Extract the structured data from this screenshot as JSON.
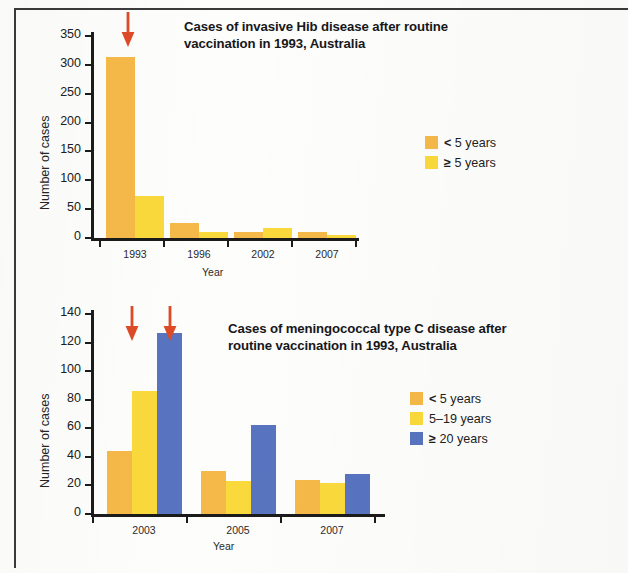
{
  "figure": {
    "background_color": "#fdfdfc",
    "border_color": "#3a3a3a"
  },
  "colors": {
    "orange": "#f5b949",
    "yellow": "#fad93c",
    "blue": "#5874c0",
    "arrow": "#dd4a26",
    "axis": "#1b1b1b"
  },
  "chart_data": [
    {
      "id": "hib",
      "type": "bar",
      "title": "Cases of invasive Hib disease after routine vaccination in 1993, Australia",
      "title_line1": "Cases of invasive Hib disease after routine",
      "title_line2": "vaccination in 1993, Australia",
      "xlabel": "Year",
      "ylabel": "Number of cases",
      "categories": [
        "1993",
        "1996",
        "2002",
        "2007"
      ],
      "ylim": [
        0,
        350
      ],
      "yticks": [
        0,
        50,
        100,
        150,
        200,
        250,
        300,
        350
      ],
      "ytick_labels": [
        "0",
        "50",
        "100",
        "150",
        "200",
        "250",
        "300",
        "350"
      ],
      "grid": false,
      "legend_position": "right",
      "series": [
        {
          "name": "< 5 years",
          "legend_prefix": "<",
          "legend_suffix": " 5 years",
          "color": "#f5b949",
          "values": [
            313,
            26,
            10,
            11
          ]
        },
        {
          "name": "≥ 5 years",
          "legend_prefix": "≥",
          "legend_suffix": " 5 years",
          "color": "#fad93c",
          "values": [
            73,
            10,
            18,
            6
          ]
        }
      ],
      "annotations": [
        {
          "type": "arrow",
          "label": "vaccination-introduced-arrow",
          "category": "1993",
          "direction": "down"
        }
      ]
    },
    {
      "id": "menc",
      "type": "bar",
      "title": "Cases of meningococcal type C disease after routine vaccination in 1993, Australia",
      "title_line1": "Cases of meningococcal type C disease after",
      "title_line2": "routine vaccination in 1993, Australia",
      "xlabel": "Year",
      "ylabel": "Number of cases",
      "categories": [
        "2003",
        "2005",
        "2007"
      ],
      "ylim": [
        0,
        140
      ],
      "yticks": [
        0,
        20,
        40,
        60,
        80,
        100,
        120,
        140
      ],
      "ytick_labels": [
        "0",
        "20",
        "40",
        "60",
        "80",
        "100",
        "120",
        "140"
      ],
      "grid": false,
      "legend_position": "right",
      "series": [
        {
          "name": "< 5 years",
          "legend_prefix": "<",
          "legend_suffix": " 5 years",
          "color": "#f5b949",
          "values": [
            44,
            30,
            24
          ]
        },
        {
          "name": "5–19 years",
          "legend_prefix": "",
          "legend_suffix": "5–19 years",
          "color": "#fad93c",
          "values": [
            86,
            23,
            22
          ]
        },
        {
          "name": "≥ 20 years",
          "legend_prefix": "≥",
          "legend_suffix": " 20 years",
          "color": "#5874c0",
          "values": [
            127,
            62,
            28
          ]
        }
      ],
      "annotations": [
        {
          "type": "arrow",
          "label": "vaccination-arrow-under-5",
          "category": "2003",
          "series": "< 5 years",
          "direction": "down"
        },
        {
          "type": "arrow",
          "label": "vaccination-arrow-5-19",
          "category": "2003",
          "series": "5–19 years",
          "direction": "down"
        }
      ]
    }
  ]
}
